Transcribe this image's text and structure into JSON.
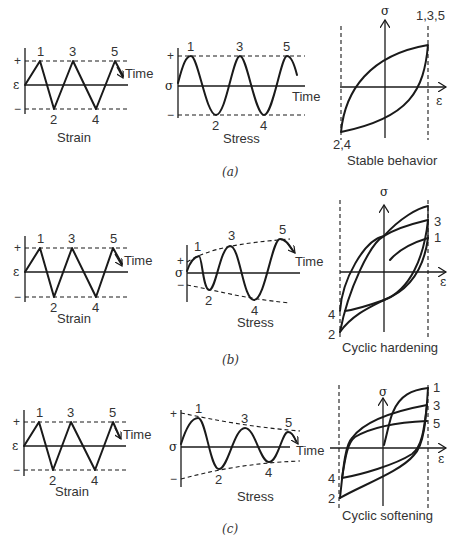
{
  "figure": {
    "rows": [
      {
        "id": "a",
        "caption": "(a)",
        "strain": {
          "title": "Strain",
          "axis_symbol": "ε",
          "plus": "+",
          "minus": "−",
          "time_label": "Time",
          "points": [
            "1",
            "2",
            "3",
            "4",
            "5"
          ]
        },
        "stress": {
          "title": "Stress",
          "axis_symbol": "σ",
          "plus": "+",
          "minus": "−",
          "time_label": "Time",
          "points": [
            "1",
            "2",
            "3",
            "4",
            "5"
          ]
        },
        "hysteresis": {
          "title": "Stable behavior",
          "sigma": "σ",
          "epsilon": "ε",
          "label_top": "1,3,5",
          "label_bottom": "2,4"
        }
      },
      {
        "id": "b",
        "caption": "(b)",
        "strain": {
          "title": "Strain",
          "axis_symbol": "ε",
          "plus": "+",
          "minus": "−",
          "time_label": "Time",
          "points": [
            "1",
            "2",
            "3",
            "4",
            "5"
          ]
        },
        "stress": {
          "title": "Stress",
          "axis_symbol": "σ",
          "plus": "+",
          "minus": "−",
          "time_label": "Time",
          "points": [
            "1",
            "2",
            "3",
            "4",
            "5"
          ]
        },
        "hysteresis": {
          "title": "Cyclic hardening",
          "sigma": "σ",
          "epsilon": "ε",
          "labels_right": [
            "3",
            "1"
          ],
          "labels_left": [
            "4",
            "2"
          ]
        }
      },
      {
        "id": "c",
        "caption": "(c)",
        "strain": {
          "title": "Strain",
          "axis_symbol": "ε",
          "plus": "+",
          "minus": "−",
          "time_label": "Time",
          "points": [
            "1",
            "2",
            "3",
            "4",
            "5"
          ]
        },
        "stress": {
          "title": "Stress",
          "axis_symbol": "σ",
          "plus": "+",
          "minus": "−",
          "time_label": "Time",
          "points": [
            "1",
            "2",
            "3",
            "4",
            "5"
          ]
        },
        "hysteresis": {
          "title": "Cyclic softening",
          "sigma": "σ",
          "epsilon": "ε",
          "labels_right": [
            "1",
            "3",
            "5"
          ],
          "labels_left": [
            "4",
            "2"
          ]
        }
      }
    ]
  }
}
